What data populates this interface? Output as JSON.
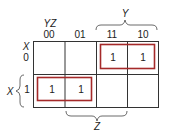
{
  "kmap": {
    "row_var": "X",
    "col_vars": "YZ",
    "col_headers": [
      "00",
      "01",
      "11",
      "10"
    ],
    "row_headers": [
      "0",
      "1"
    ],
    "cells": [
      [
        "",
        "",
        "1",
        "1"
      ],
      [
        "1",
        "1",
        "",
        ""
      ]
    ],
    "groups": [
      {
        "name": "group-xbar-y",
        "row": 0,
        "cols": [
          2,
          3
        ]
      },
      {
        "name": "group-x-ybar",
        "row": 1,
        "cols": [
          0,
          1
        ]
      }
    ],
    "brace_labels": {
      "y": "Y",
      "z": "Z",
      "x": "X"
    },
    "colors": {
      "grid": "#333333",
      "group": "#a52a2a"
    }
  }
}
